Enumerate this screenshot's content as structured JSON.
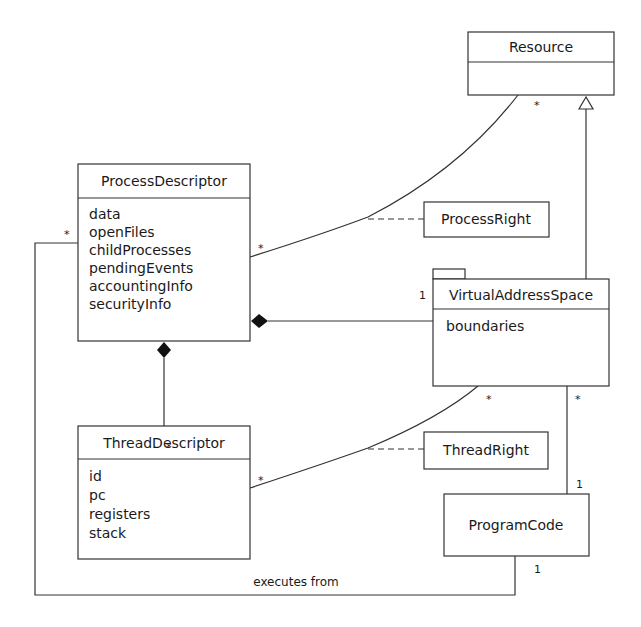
{
  "diagram": {
    "type": "uml-class-diagram",
    "classes": {
      "resource": {
        "name": "Resource",
        "attributes": []
      },
      "process_descriptor": {
        "name": "ProcessDescriptor",
        "attributes": [
          "data",
          "openFiles",
          "childProcesses",
          "pendingEvents",
          "accountingInfo",
          "securityInfo"
        ]
      },
      "virtual_address_space": {
        "name": "VirtualAddressSpace",
        "attributes": [
          "boundaries"
        ]
      },
      "thread_descriptor": {
        "name": "ThreadDescriptor",
        "attributes": [
          "id",
          "pc",
          "registers",
          "stack"
        ]
      },
      "program_code": {
        "name": "ProgramCode"
      },
      "process_right": {
        "name": "ProcessRight"
      },
      "thread_right": {
        "name": "ThreadRight"
      }
    },
    "relations": {
      "process_resource": {
        "from_mult": "*",
        "to_mult": "*",
        "association_class": "ProcessRight"
      },
      "vas_resource": {
        "kind": "generalization"
      },
      "process_vas": {
        "kind": "composition",
        "vas_mult": "1"
      },
      "process_thread": {
        "kind": "composition",
        "thread_mult": "*"
      },
      "thread_vas": {
        "from_mult": "*",
        "to_mult": "*",
        "association_class": "ThreadRight"
      },
      "vas_program": {
        "vas_mult": "*",
        "program_mult": "1"
      },
      "process_program": {
        "label": "executes from",
        "process_mult": "*",
        "program_mult": "1"
      }
    }
  }
}
